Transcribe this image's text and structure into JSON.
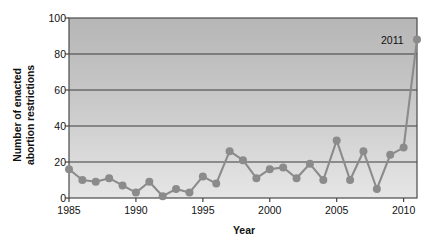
{
  "chart_data": {
    "type": "line",
    "title": "",
    "xlabel": "Year",
    "ylabel": "Number of enacted abortion restrictions",
    "ylabel_line1": "Number of enacted",
    "ylabel_line2": "abortion restrictions",
    "xlim": [
      1985,
      2011
    ],
    "ylim": [
      0,
      100
    ],
    "ytick_labels": [
      "0",
      "20",
      "40",
      "60",
      "80",
      "100"
    ],
    "ytick_values": [
      0,
      20,
      40,
      60,
      80,
      100
    ],
    "xtick_labels": [
      "1985",
      "1990",
      "1995",
      "2000",
      "2005",
      "2010"
    ],
    "xtick_values": [
      1985,
      1990,
      1995,
      2000,
      2005,
      2010
    ],
    "grid": "horizontal",
    "legend": "none",
    "marker": "circle",
    "x": [
      1985,
      1986,
      1987,
      1988,
      1989,
      1990,
      1991,
      1992,
      1993,
      1994,
      1995,
      1996,
      1997,
      1998,
      1999,
      2000,
      2001,
      2002,
      2003,
      2004,
      2005,
      2006,
      2007,
      2008,
      2009,
      2010,
      2011
    ],
    "values": [
      16,
      10,
      9,
      11,
      7,
      3,
      9,
      1,
      5,
      3,
      12,
      8,
      26,
      21,
      11,
      16,
      17,
      11,
      19,
      10,
      32,
      10,
      26,
      5,
      24,
      28,
      88
    ],
    "annotations": [
      {
        "label": "2011",
        "x": 2011,
        "y": 88
      }
    ],
    "colors": {
      "series": "#8b8b8b",
      "marker": "#8b8b8b",
      "axis": "#444444",
      "grid": "#3d3d3d",
      "plot_bg_top": "#b8b8b8",
      "plot_bg_bottom": "#e3e3e3",
      "text": "#111111"
    }
  }
}
